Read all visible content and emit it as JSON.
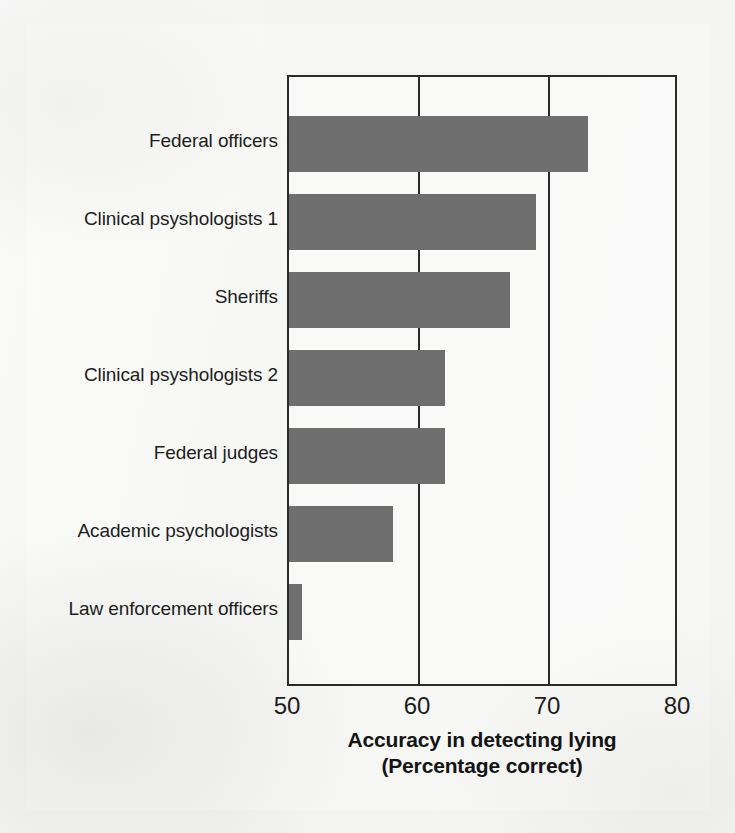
{
  "figure": {
    "background_color": "#f3f3f2",
    "bar_color": "#6e6e6e",
    "axis_color": "#2b2b2b",
    "text_color": "#1d1d1d"
  },
  "axis_title": {
    "line1": "Accuracy in detecting lying",
    "line2": "(Percentage correct)"
  },
  "xticks": [
    {
      "label": "50",
      "value": 50
    },
    {
      "label": "60",
      "value": 60
    },
    {
      "label": "70",
      "value": 70
    },
    {
      "label": "80",
      "value": 80
    }
  ],
  "gridlines": [
    60,
    70
  ],
  "chart_data": {
    "type": "bar",
    "orientation": "horizontal",
    "title": "",
    "subtitle": "",
    "xlabel": "Accuracy in detecting lying (Percentage correct)",
    "ylabel": "",
    "xlim": [
      50,
      80
    ],
    "xticks": [
      50,
      60,
      70,
      80
    ],
    "grid": true,
    "grid_axis": "x",
    "legend": false,
    "legend_position": "none",
    "categories": [
      "Federal officers",
      "Clinical psyshologists 1",
      "Sheriffs",
      "Clinical psyshologists 2",
      "Federal judges",
      "Academic psychologists",
      "Law enforcement officers"
    ],
    "values": [
      73,
      69,
      67,
      62,
      62,
      58,
      51
    ],
    "series": [
      {
        "name": "Accuracy in detecting lying",
        "values": [
          73,
          69,
          67,
          62,
          62,
          58,
          51
        ]
      }
    ]
  }
}
